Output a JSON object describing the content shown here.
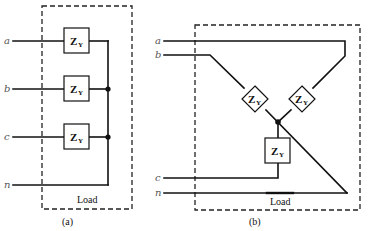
{
  "diagram": {
    "panel_a": {
      "caption": "(a)",
      "enclosure_label": "Load",
      "terminals": [
        "a",
        "b",
        "c",
        "n"
      ],
      "impedances": [
        {
          "symbol": "Z",
          "subscript": "Y",
          "phase": "a"
        },
        {
          "symbol": "Z",
          "subscript": "Y",
          "phase": "b"
        },
        {
          "symbol": "Z",
          "subscript": "Y",
          "phase": "c"
        }
      ]
    },
    "panel_b": {
      "caption": "(b)",
      "enclosure_label": "Load",
      "terminals": [
        "a",
        "b",
        "c",
        "n"
      ],
      "impedances": [
        {
          "symbol": "Z",
          "subscript": "Y",
          "phase": "b"
        },
        {
          "symbol": "Z",
          "subscript": "Y",
          "phase": "a"
        },
        {
          "symbol": "Z",
          "subscript": "Y",
          "phase": "c"
        }
      ]
    },
    "colors": {
      "line": "#111111",
      "terminal_label": "#555555",
      "background": "#ffffff"
    }
  }
}
